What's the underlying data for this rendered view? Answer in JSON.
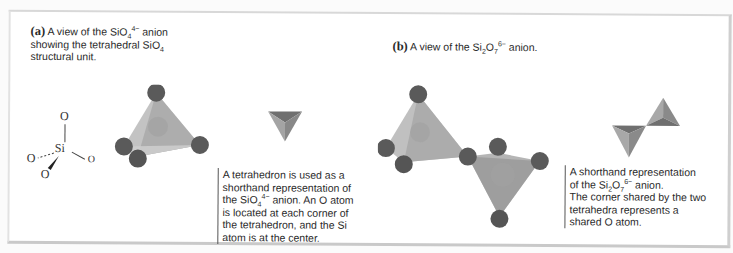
{
  "figure": {
    "panel_a": {
      "label": "(a)",
      "title_parts": {
        "pre": "A view of the SiO",
        "sub": "4",
        "sup": "4−",
        "post": " anion",
        "line2_pre": "showing the tetrahedral SiO",
        "line2_sub": "4",
        "line3": "structural unit."
      },
      "lewis": {
        "si": "Si",
        "o_top": "O",
        "o_left": "O",
        "o_right": "O",
        "o_bottom": "O"
      },
      "caption_parts": {
        "l1": "A tetrahedron is used as a",
        "l2": "shorthand representation of",
        "l3_pre": "the SiO",
        "l3_sub": "4",
        "l3_sup": "4−",
        "l3_post": " anion. An O atom",
        "l4": "is located at each corner of",
        "l5": "the tetrahedron, and the Si",
        "l6": "atom is at the center."
      }
    },
    "panel_b": {
      "label": "(b)",
      "title_parts": {
        "pre": "A view of the Si",
        "sub1": "2",
        "mid": "O",
        "sub2": "7",
        "sup": "6−",
        "post": " anion."
      },
      "caption_parts": {
        "l1": "A shorthand representation",
        "l2_pre": "of the Si",
        "l2_sub1": "2",
        "l2_mid": "O",
        "l2_sub2": "7",
        "l2_sup": "6−",
        "l2_post": " anion.",
        "l3": "The corner shared by the two",
        "l4": "tetrahedra represents a",
        "l5": "shared O atom."
      }
    },
    "colors": {
      "atom": "#5a5a5a",
      "tetra_light": "#bdbdbd",
      "tetra_mid": "#9a9a9a",
      "tetra_dark": "#6f6f6f"
    }
  }
}
